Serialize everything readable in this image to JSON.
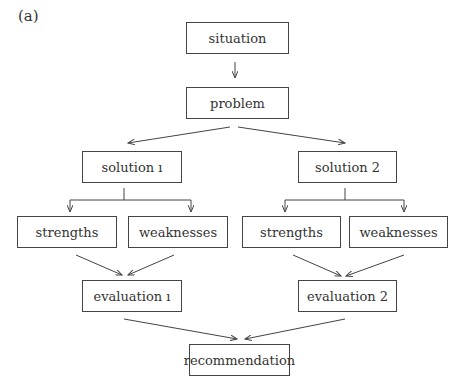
{
  "panel_label": "(a)",
  "nodes": {
    "situation": {
      "label": "situation",
      "x": 186,
      "y": 22,
      "w": 103,
      "h": 32
    },
    "problem": {
      "label": "problem",
      "x": 186,
      "y": 87,
      "w": 103,
      "h": 32
    },
    "solution1": {
      "label": "solution ı",
      "x": 82,
      "y": 151,
      "w": 100,
      "h": 32
    },
    "solution2": {
      "label": "solution 2",
      "x": 298,
      "y": 151,
      "w": 99,
      "h": 32
    },
    "strengths1": {
      "label": "strengths",
      "x": 17,
      "y": 216,
      "w": 100,
      "h": 32
    },
    "weaknesses1": {
      "label": "weaknesses",
      "x": 128,
      "y": 216,
      "w": 100,
      "h": 32
    },
    "strengths2": {
      "label": "strengths",
      "x": 242,
      "y": 216,
      "w": 99,
      "h": 32
    },
    "weaknesses2": {
      "label": "weaknesses",
      "x": 349,
      "y": 216,
      "w": 99,
      "h": 32
    },
    "evaluation1": {
      "label": "evaluation ı",
      "x": 82,
      "y": 280,
      "w": 100,
      "h": 32
    },
    "evaluation2": {
      "label": "evaluation 2",
      "x": 298,
      "y": 280,
      "w": 99,
      "h": 32
    },
    "recommendation": {
      "label": "recommendation",
      "x": 189,
      "y": 344,
      "w": 101,
      "h": 32
    }
  },
  "edges": [
    {
      "from": "situation",
      "to": "problem"
    },
    {
      "from": "problem",
      "to": "solution1"
    },
    {
      "from": "problem",
      "to": "solution2"
    },
    {
      "from": "solution1",
      "to": "strengths1"
    },
    {
      "from": "solution1",
      "to": "weaknesses1"
    },
    {
      "from": "solution2",
      "to": "strengths2"
    },
    {
      "from": "solution2",
      "to": "weaknesses2"
    },
    {
      "from": "strengths1",
      "to": "evaluation1"
    },
    {
      "from": "weaknesses1",
      "to": "evaluation1"
    },
    {
      "from": "strengths2",
      "to": "evaluation2"
    },
    {
      "from": "weaknesses2",
      "to": "evaluation2"
    },
    {
      "from": "evaluation1",
      "to": "recommendation"
    },
    {
      "from": "evaluation2",
      "to": "recommendation"
    }
  ]
}
